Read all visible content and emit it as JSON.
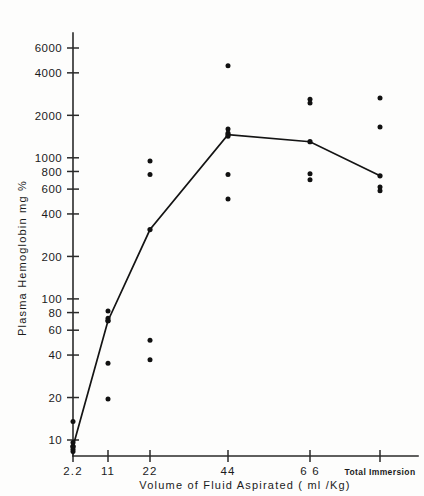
{
  "chart_data": {
    "type": "scatter",
    "title": "",
    "xlabel": "Volume of Fluid Aspirated ( ml /Kg)",
    "ylabel": "Plasma  Hemoglobin  mg  %",
    "yscale": "log",
    "ylim": [
      8,
      7500
    ],
    "ytick_labels": [
      "10",
      "20",
      "40",
      "60",
      "80",
      "1000",
      "200",
      "400",
      "600",
      "800",
      "1000",
      "2000",
      "4000",
      "6000"
    ],
    "yticks": [
      10,
      20,
      40,
      60,
      80,
      100,
      200,
      400,
      600,
      800,
      1000,
      2000,
      4000,
      6000
    ],
    "ytick_text": {
      "10": "10",
      "20": "20",
      "40": "40",
      "60": "60",
      "80": "80",
      "100": "100",
      "200": "200",
      "400": "400",
      "600": "600",
      "800": "800",
      "1000": "1000",
      "2000": "2000",
      "4000": "4000",
      "6000": "6000"
    },
    "categories": [
      "2.2",
      "11",
      "22",
      "44",
      "66",
      "Total Immersion"
    ],
    "xtick_labels": [
      "2.2",
      "11",
      "22",
      "44",
      "6 6",
      "Total  Immersion"
    ],
    "grid": false,
    "legend": "none",
    "series": [
      {
        "name": "individual values",
        "type": "scatter",
        "points": [
          {
            "category": "2.2",
            "value": 13.5
          },
          {
            "category": "2.2",
            "value": 9.6
          },
          {
            "category": "2.2",
            "value": 9.0
          },
          {
            "category": "2.2",
            "value": 8.6
          },
          {
            "category": "2.2",
            "value": 8.3
          },
          {
            "category": "11",
            "value": 82
          },
          {
            "category": "11",
            "value": 73
          },
          {
            "category": "11",
            "value": 70
          },
          {
            "category": "11",
            "value": 35
          },
          {
            "category": "11",
            "value": 19.5
          },
          {
            "category": "22",
            "value": 950
          },
          {
            "category": "22",
            "value": 760
          },
          {
            "category": "22",
            "value": 51
          },
          {
            "category": "22",
            "value": 37
          },
          {
            "category": "44",
            "value": 4500
          },
          {
            "category": "44",
            "value": 1600
          },
          {
            "category": "44",
            "value": 1500
          },
          {
            "category": "44",
            "value": 1420
          },
          {
            "category": "44",
            "value": 760
          },
          {
            "category": "44",
            "value": 510
          },
          {
            "category": "66",
            "value": 2600
          },
          {
            "category": "66",
            "value": 2450
          },
          {
            "category": "66",
            "value": 770
          },
          {
            "category": "66",
            "value": 700
          },
          {
            "category": "Total Immersion",
            "value": 2650
          },
          {
            "category": "Total Immersion",
            "value": 1650
          },
          {
            "category": "Total Immersion",
            "value": 620
          },
          {
            "category": "Total Immersion",
            "value": 585
          }
        ]
      },
      {
        "name": "mean response",
        "type": "line",
        "categories": [
          "2.2",
          "11",
          "22",
          "44",
          "66",
          "Total Immersion"
        ],
        "values": [
          9.0,
          70,
          310,
          1460,
          1300,
          745
        ]
      }
    ]
  },
  "axes": {
    "y_title": "Plasma  Hemoglobin  mg  %",
    "x_title": "Volume  of  Fluid  Aspirated  ( ml /Kg)"
  }
}
